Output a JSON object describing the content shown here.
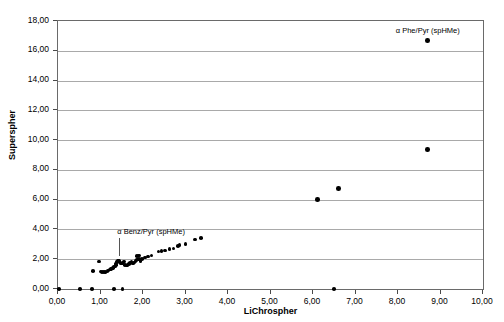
{
  "chart_data": {
    "type": "scatter",
    "title": "",
    "xlabel": "LiChrospher",
    "ylabel": "Superspher",
    "xlim": [
      0.0,
      10.0
    ],
    "ylim": [
      0.0,
      18.0
    ],
    "xticks": [
      "0,00",
      "1,00",
      "2,00",
      "3,00",
      "4,00",
      "5,00",
      "6,00",
      "7,00",
      "8,00",
      "9,00",
      "10,00"
    ],
    "xtick_values": [
      0,
      1,
      2,
      3,
      4,
      5,
      6,
      7,
      8,
      9,
      10
    ],
    "yticks": [
      "0,00",
      "2,00",
      "4,00",
      "6,00",
      "8,00",
      "10,00",
      "12,00",
      "14,00",
      "16,00",
      "18,00"
    ],
    "ytick_values": [
      0,
      2,
      4,
      6,
      8,
      10,
      12,
      14,
      16,
      18
    ],
    "grid": "horizontal",
    "legend": "none",
    "decimal_separator": ",",
    "marker": "filled-circle",
    "marker_color": "#000000",
    "series": [
      {
        "name": "selectivity pairs",
        "points": [
          [
            0.02,
            0.0
          ],
          [
            0.52,
            0.0
          ],
          [
            0.8,
            0.0
          ],
          [
            1.32,
            0.0
          ],
          [
            1.52,
            0.0
          ],
          [
            6.5,
            0.0
          ],
          [
            0.82,
            1.22
          ],
          [
            0.97,
            1.85
          ],
          [
            1.0,
            1.18
          ],
          [
            1.04,
            1.15
          ],
          [
            1.08,
            1.14
          ],
          [
            1.12,
            1.16
          ],
          [
            1.16,
            1.2
          ],
          [
            1.19,
            1.25
          ],
          [
            1.22,
            1.3
          ],
          [
            1.25,
            1.34
          ],
          [
            1.27,
            1.38
          ],
          [
            1.29,
            1.42
          ],
          [
            1.31,
            1.46
          ],
          [
            1.33,
            1.5
          ],
          [
            1.35,
            1.55
          ],
          [
            1.36,
            1.62
          ],
          [
            1.37,
            1.7
          ],
          [
            1.38,
            1.78
          ],
          [
            1.39,
            1.86
          ],
          [
            1.41,
            1.92
          ],
          [
            1.43,
            1.88
          ],
          [
            1.45,
            1.8
          ],
          [
            1.47,
            1.74
          ],
          [
            1.49,
            1.7
          ],
          [
            1.52,
            1.74
          ],
          [
            1.54,
            1.8
          ],
          [
            1.56,
            1.86
          ],
          [
            1.58,
            1.62
          ],
          [
            1.61,
            1.58
          ],
          [
            1.64,
            1.62
          ],
          [
            1.67,
            1.68
          ],
          [
            1.7,
            1.74
          ],
          [
            1.73,
            1.8
          ],
          [
            1.76,
            1.72
          ],
          [
            1.79,
            1.78
          ],
          [
            1.82,
            1.9
          ],
          [
            1.85,
            1.96
          ],
          [
            1.88,
            1.98
          ],
          [
            1.91,
            2.02
          ],
          [
            1.94,
            1.9
          ],
          [
            1.97,
            2.0
          ],
          [
            1.86,
            2.2
          ],
          [
            1.9,
            2.26
          ],
          [
            2.05,
            2.12
          ],
          [
            2.12,
            2.18
          ],
          [
            2.2,
            2.24
          ],
          [
            2.36,
            2.52
          ],
          [
            2.44,
            2.56
          ],
          [
            2.52,
            2.58
          ],
          [
            2.62,
            2.68
          ],
          [
            2.72,
            2.72
          ],
          [
            2.82,
            2.88
          ],
          [
            2.86,
            2.94
          ],
          [
            3.0,
            3.04
          ],
          [
            3.22,
            3.32
          ],
          [
            3.36,
            3.42
          ],
          [
            6.1,
            6.0
          ],
          [
            6.6,
            6.75
          ],
          [
            8.7,
            9.35
          ],
          [
            8.7,
            16.7
          ]
        ]
      }
    ],
    "annotations": [
      {
        "id": "phe-pyr",
        "text": "α Phe/Pyr (spHMe)",
        "x": 8.7,
        "y": 16.7,
        "label_offset_x": 0,
        "label_offset_y": -14,
        "has_arrow": false
      },
      {
        "id": "benz-pyr",
        "text": "α Benz/Pyr (spHMe)",
        "x": 0.97,
        "y": 1.85,
        "label_offset_x": 18,
        "label_offset_y": -34,
        "has_arrow": true
      }
    ]
  },
  "axes": {
    "x_title": "LiChrospher",
    "y_title": "Superspher"
  },
  "colors": {
    "marker": "#000000",
    "gridline": "#a9a9a9",
    "frame": "#6a6a6a",
    "background": "#ffffff",
    "text": "#000000",
    "arrow": "#555555"
  }
}
